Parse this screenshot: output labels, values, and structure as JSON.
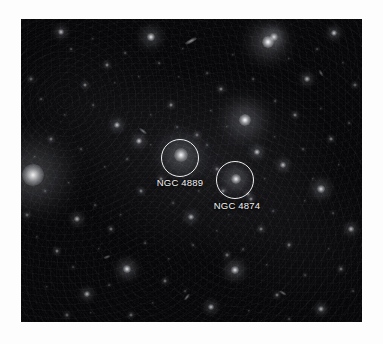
{
  "figure": {
    "background_color": "#fdfdfd",
    "plate_color": "#050507",
    "annotation_color": "#ffffff",
    "label_color": "#f2f2f2"
  },
  "annotations": [
    {
      "name": "ngc-4889",
      "label": "NGC 4889",
      "circle": {
        "cx": 159,
        "cy": 139,
        "r": 19
      },
      "label_pos": {
        "x": 159,
        "y": 158
      }
    },
    {
      "name": "ngc-4874",
      "label": "NGC 4874",
      "circle": {
        "cx": 214,
        "cy": 161,
        "r": 19
      },
      "label_pos": {
        "x": 216,
        "y": 181
      }
    }
  ],
  "objects": [
    {
      "x": 12,
      "y": 156,
      "r": 11,
      "b": 0.95,
      "halo": 3.2
    },
    {
      "x": 160,
      "y": 136,
      "r": 7,
      "b": 0.98,
      "halo": 2.8
    },
    {
      "x": 215,
      "y": 160,
      "r": 5,
      "b": 0.95,
      "halo": 2.6
    },
    {
      "x": 224,
      "y": 101,
      "r": 6,
      "b": 1.0,
      "halo": 3.4
    },
    {
      "x": 247,
      "y": 23,
      "r": 6,
      "b": 1.0,
      "halo": 3.2
    },
    {
      "x": 130,
      "y": 18,
      "r": 4,
      "b": 0.9,
      "halo": 2.6
    },
    {
      "x": 253,
      "y": 18,
      "r": 4,
      "b": 0.85,
      "halo": 2.4
    },
    {
      "x": 106,
      "y": 250,
      "r": 4,
      "b": 0.9,
      "halo": 2.4
    },
    {
      "x": 214,
      "y": 251,
      "r": 4,
      "b": 0.88,
      "halo": 2.4
    },
    {
      "x": 300,
      "y": 170,
      "r": 4,
      "b": 0.85,
      "halo": 2.3
    },
    {
      "x": 313,
      "y": 14,
      "r": 3,
      "b": 0.8,
      "halo": 2.2
    },
    {
      "x": 40,
      "y": 13,
      "r": 3,
      "b": 0.75,
      "halo": 2.1
    },
    {
      "x": 96,
      "y": 106,
      "r": 3,
      "b": 0.78,
      "halo": 2.1
    },
    {
      "x": 118,
      "y": 122,
      "r": 3,
      "b": 0.8,
      "halo": 2.1
    },
    {
      "x": 170,
      "y": 198,
      "r": 3,
      "b": 0.72,
      "halo": 2.0
    },
    {
      "x": 236,
      "y": 133,
      "r": 3,
      "b": 0.8,
      "halo": 2.1
    },
    {
      "x": 262,
      "y": 146,
      "r": 3,
      "b": 0.75,
      "halo": 2.0
    },
    {
      "x": 286,
      "y": 60,
      "r": 3,
      "b": 0.7,
      "halo": 2.0
    },
    {
      "x": 56,
      "y": 200,
      "r": 3,
      "b": 0.7,
      "halo": 2.0
    },
    {
      "x": 66,
      "y": 275,
      "r": 3,
      "b": 0.7,
      "halo": 2.0
    },
    {
      "x": 190,
      "y": 288,
      "r": 3,
      "b": 0.72,
      "halo": 2.0
    },
    {
      "x": 330,
      "y": 210,
      "r": 3,
      "b": 0.72,
      "halo": 2.0
    },
    {
      "x": 300,
      "y": 290,
      "r": 3,
      "b": 0.68,
      "halo": 1.9
    },
    {
      "x": 150,
      "y": 86,
      "r": 2,
      "b": 0.6,
      "halo": 1.8
    },
    {
      "x": 86,
      "y": 46,
      "r": 2,
      "b": 0.6,
      "halo": 1.8
    },
    {
      "x": 64,
      "y": 66,
      "r": 2,
      "b": 0.55,
      "halo": 1.7
    },
    {
      "x": 200,
      "y": 70,
      "r": 2,
      "b": 0.6,
      "halo": 1.8
    },
    {
      "x": 274,
      "y": 96,
      "r": 2,
      "b": 0.55,
      "halo": 1.7
    },
    {
      "x": 310,
      "y": 120,
      "r": 2,
      "b": 0.55,
      "halo": 1.7
    },
    {
      "x": 140,
      "y": 160,
      "r": 2,
      "b": 0.6,
      "halo": 1.8
    },
    {
      "x": 120,
      "y": 172,
      "r": 2,
      "b": 0.55,
      "halo": 1.7
    },
    {
      "x": 30,
      "y": 120,
      "r": 2,
      "b": 0.5,
      "halo": 1.6
    },
    {
      "x": 36,
      "y": 232,
      "r": 2,
      "b": 0.55,
      "halo": 1.7
    },
    {
      "x": 90,
      "y": 210,
      "r": 2,
      "b": 0.5,
      "halo": 1.6
    },
    {
      "x": 240,
      "y": 210,
      "r": 2,
      "b": 0.55,
      "halo": 1.7
    },
    {
      "x": 268,
      "y": 226,
      "r": 2,
      "b": 0.5,
      "halo": 1.6
    },
    {
      "x": 206,
      "y": 236,
      "r": 2,
      "b": 0.5,
      "halo": 1.6
    },
    {
      "x": 144,
      "y": 262,
      "r": 2,
      "b": 0.5,
      "halo": 1.6
    },
    {
      "x": 256,
      "y": 276,
      "r": 2,
      "b": 0.5,
      "halo": 1.6
    },
    {
      "x": 320,
      "y": 250,
      "r": 2,
      "b": 0.5,
      "halo": 1.6
    },
    {
      "x": 176,
      "y": 116,
      "r": 2,
      "b": 0.5,
      "halo": 1.6
    },
    {
      "x": 196,
      "y": 150,
      "r": 2,
      "b": 0.5,
      "halo": 1.6
    },
    {
      "x": 230,
      "y": 180,
      "r": 2,
      "b": 0.6,
      "halo": 1.8
    },
    {
      "x": 202,
      "y": 172,
      "r": 2,
      "b": 0.55,
      "halo": 1.7
    },
    {
      "x": 227,
      "y": 175,
      "r": 2,
      "b": 0.5,
      "halo": 1.6
    },
    {
      "x": 10,
      "y": 60,
      "r": 2,
      "b": 0.45,
      "halo": 1.5
    },
    {
      "x": 6,
      "y": 196,
      "r": 2,
      "b": 0.45,
      "halo": 1.5
    },
    {
      "x": 334,
      "y": 66,
      "r": 2,
      "b": 0.45,
      "halo": 1.5
    },
    {
      "x": 110,
      "y": 296,
      "r": 2,
      "b": 0.45,
      "halo": 1.5
    },
    {
      "x": 46,
      "y": 296,
      "r": 2,
      "b": 0.42,
      "halo": 1.5
    }
  ],
  "faint_objects": [
    {
      "x": 50,
      "y": 30,
      "r": 1.4,
      "b": 0.35
    },
    {
      "x": 72,
      "y": 20,
      "r": 1.2,
      "b": 0.3
    },
    {
      "x": 104,
      "y": 34,
      "r": 1.4,
      "b": 0.34
    },
    {
      "x": 118,
      "y": 58,
      "r": 1.2,
      "b": 0.3
    },
    {
      "x": 138,
      "y": 44,
      "r": 1.4,
      "b": 0.34
    },
    {
      "x": 162,
      "y": 30,
      "r": 1.2,
      "b": 0.3
    },
    {
      "x": 186,
      "y": 54,
      "r": 1.4,
      "b": 0.33
    },
    {
      "x": 212,
      "y": 36,
      "r": 1.2,
      "b": 0.3
    },
    {
      "x": 232,
      "y": 60,
      "r": 1.4,
      "b": 0.33
    },
    {
      "x": 268,
      "y": 40,
      "r": 1.2,
      "b": 0.3
    },
    {
      "x": 296,
      "y": 30,
      "r": 1.4,
      "b": 0.32
    },
    {
      "x": 322,
      "y": 44,
      "r": 1.2,
      "b": 0.3
    },
    {
      "x": 20,
      "y": 80,
      "r": 1.4,
      "b": 0.33
    },
    {
      "x": 44,
      "y": 96,
      "r": 1.2,
      "b": 0.3
    },
    {
      "x": 72,
      "y": 86,
      "r": 1.4,
      "b": 0.33
    },
    {
      "x": 130,
      "y": 96,
      "r": 1.2,
      "b": 0.3
    },
    {
      "x": 156,
      "y": 108,
      "r": 1.4,
      "b": 0.32
    },
    {
      "x": 190,
      "y": 92,
      "r": 1.2,
      "b": 0.3
    },
    {
      "x": 254,
      "y": 82,
      "r": 1.4,
      "b": 0.32
    },
    {
      "x": 300,
      "y": 90,
      "r": 1.2,
      "b": 0.3
    },
    {
      "x": 328,
      "y": 104,
      "r": 1.4,
      "b": 0.31
    },
    {
      "x": 14,
      "y": 138,
      "r": 1.2,
      "b": 0.3
    },
    {
      "x": 60,
      "y": 130,
      "r": 1.4,
      "b": 0.32
    },
    {
      "x": 84,
      "y": 148,
      "r": 1.2,
      "b": 0.3
    },
    {
      "x": 106,
      "y": 140,
      "r": 1.4,
      "b": 0.32
    },
    {
      "x": 130,
      "y": 126,
      "r": 1.2,
      "b": 0.3
    },
    {
      "x": 186,
      "y": 126,
      "r": 1.4,
      "b": 0.31
    },
    {
      "x": 254,
      "y": 118,
      "r": 1.2,
      "b": 0.3
    },
    {
      "x": 282,
      "y": 130,
      "r": 1.4,
      "b": 0.31
    },
    {
      "x": 318,
      "y": 146,
      "r": 1.2,
      "b": 0.3
    },
    {
      "x": 24,
      "y": 172,
      "r": 1.4,
      "b": 0.31
    },
    {
      "x": 48,
      "y": 164,
      "r": 1.2,
      "b": 0.3
    },
    {
      "x": 74,
      "y": 186,
      "r": 1.4,
      "b": 0.31
    },
    {
      "x": 100,
      "y": 196,
      "r": 1.2,
      "b": 0.3
    },
    {
      "x": 152,
      "y": 184,
      "r": 1.4,
      "b": 0.3
    },
    {
      "x": 178,
      "y": 172,
      "r": 1.2,
      "b": 0.28
    },
    {
      "x": 252,
      "y": 192,
      "r": 1.4,
      "b": 0.3
    },
    {
      "x": 284,
      "y": 182,
      "r": 1.2,
      "b": 0.28
    },
    {
      "x": 312,
      "y": 194,
      "r": 1.4,
      "b": 0.3
    },
    {
      "x": 16,
      "y": 218,
      "r": 1.2,
      "b": 0.28
    },
    {
      "x": 52,
      "y": 248,
      "r": 1.4,
      "b": 0.3
    },
    {
      "x": 78,
      "y": 230,
      "r": 1.2,
      "b": 0.28
    },
    {
      "x": 124,
      "y": 224,
      "r": 1.4,
      "b": 0.3
    },
    {
      "x": 148,
      "y": 240,
      "r": 1.2,
      "b": 0.28
    },
    {
      "x": 172,
      "y": 226,
      "r": 1.4,
      "b": 0.3
    },
    {
      "x": 196,
      "y": 212,
      "r": 1.2,
      "b": 0.28
    },
    {
      "x": 222,
      "y": 230,
      "r": 1.4,
      "b": 0.29
    },
    {
      "x": 246,
      "y": 246,
      "r": 1.2,
      "b": 0.28
    },
    {
      "x": 284,
      "y": 256,
      "r": 1.4,
      "b": 0.29
    },
    {
      "x": 308,
      "y": 230,
      "r": 1.2,
      "b": 0.27
    },
    {
      "x": 332,
      "y": 272,
      "r": 1.4,
      "b": 0.28
    },
    {
      "x": 26,
      "y": 268,
      "r": 1.2,
      "b": 0.27
    },
    {
      "x": 88,
      "y": 266,
      "r": 1.4,
      "b": 0.28
    },
    {
      "x": 132,
      "y": 284,
      "r": 1.2,
      "b": 0.27
    },
    {
      "x": 164,
      "y": 272,
      "r": 1.4,
      "b": 0.28
    },
    {
      "x": 228,
      "y": 292,
      "r": 1.2,
      "b": 0.27
    },
    {
      "x": 268,
      "y": 300,
      "r": 1.4,
      "b": 0.27
    },
    {
      "x": 70,
      "y": 294,
      "r": 1.2,
      "b": 0.26
    },
    {
      "x": 158,
      "y": 58,
      "r": 1.2,
      "b": 0.28
    },
    {
      "x": 206,
      "y": 108,
      "r": 1.2,
      "b": 0.28
    },
    {
      "x": 94,
      "y": 64,
      "r": 1.2,
      "b": 0.27
    },
    {
      "x": 292,
      "y": 160,
      "r": 1.2,
      "b": 0.27
    },
    {
      "x": 244,
      "y": 160,
      "r": 1.2,
      "b": 0.27
    },
    {
      "x": 208,
      "y": 196,
      "r": 1.2,
      "b": 0.26
    }
  ],
  "streaks": [
    {
      "x": 170,
      "y": 22,
      "w": 13,
      "h": 4,
      "rot": -28,
      "b": 0.55
    },
    {
      "x": 122,
      "y": 112,
      "w": 9,
      "h": 3,
      "rot": 38,
      "b": 0.45
    },
    {
      "x": 166,
      "y": 278,
      "w": 8,
      "h": 3,
      "rot": -52,
      "b": 0.42
    },
    {
      "x": 262,
      "y": 274,
      "w": 8,
      "h": 3,
      "rot": 32,
      "b": 0.4
    },
    {
      "x": 86,
      "y": 238,
      "w": 7,
      "h": 3,
      "rot": -20,
      "b": 0.36
    },
    {
      "x": 300,
      "y": 54,
      "w": 7,
      "h": 3,
      "rot": 60,
      "b": 0.35
    }
  ]
}
